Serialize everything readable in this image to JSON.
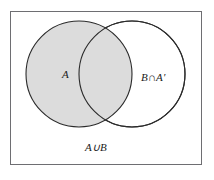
{
  "figure": {
    "type": "venn-diagram",
    "frame": {
      "border_color": "#6e6e72",
      "background_color": "#ffffff"
    },
    "colors": {
      "shaded_fill": "#dcdcdc",
      "unshaded_fill": "#ffffff",
      "outline": "#2b2b2b",
      "text": "#1a1a1a"
    },
    "sets": [
      {
        "name": "set-a",
        "label": "A",
        "shaded": true,
        "fill": "#dcdcdc",
        "cx": 79,
        "cy": 74,
        "r": 53
      },
      {
        "name": "set-b",
        "label": "B",
        "shaded": false,
        "fill": "#ffffff",
        "cx": 132,
        "cy": 74,
        "r": 53
      }
    ],
    "labels": {
      "set_a": "A",
      "b_minus_a": "B∩A′",
      "union": "A∪B"
    }
  }
}
